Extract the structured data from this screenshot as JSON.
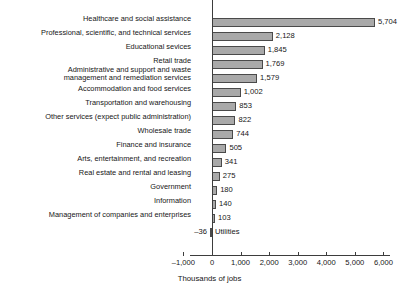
{
  "chart_data": {
    "type": "bar",
    "orientation": "horizontal",
    "title": "",
    "xlabel": "Thousands of jobs",
    "ylabel": "",
    "xlim": [
      -1000,
      6000
    ],
    "grid": false,
    "legend": null,
    "xticks": [
      -1000,
      0,
      1000,
      2000,
      3000,
      4000,
      5000,
      6000
    ],
    "xticklabels": [
      "–1,000",
      "0",
      "1,000",
      "2,000",
      "3,000",
      "4,000",
      "5,000",
      "6,000"
    ],
    "categories": [
      "Healthcare and social assistance",
      "Professional, scientific, and technical services",
      "Educational sevices",
      "Retail trade",
      "Administrative and support and waste\nmanagement and remediation services",
      "Accommodation and food services",
      "Transportation and warehousing",
      "Other services (expect public administration)",
      "Wholesale trade",
      "Finance and insurance",
      "Arts, entertainment, and recreation",
      "Real estate and rental and leasing",
      "Government",
      "Information",
      "Management of companies and enterprises",
      "Utilities"
    ],
    "values": [
      5704,
      2128,
      1845,
      1769,
      1579,
      1002,
      853,
      822,
      744,
      505,
      341,
      275,
      180,
      140,
      103,
      -36
    ],
    "value_labels": [
      "5,704",
      "2,128",
      "1,845",
      "1,769",
      "1,579",
      "1,002",
      "853",
      "822",
      "744",
      "505",
      "341",
      "275",
      "180",
      "140",
      "103",
      "–36"
    ],
    "bar_fill_color": "#a9a9a9",
    "bar_edge_color": "#4a4a4a",
    "axis_color": "#3d3d3d",
    "text_color": "#161616",
    "background_color": "#ffffff"
  }
}
